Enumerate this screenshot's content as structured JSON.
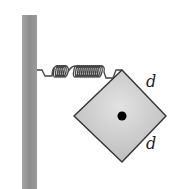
{
  "diagram": {
    "labels": {
      "side_top": "d",
      "side_bottom": "d"
    },
    "colors": {
      "wall": "#8f8f8f",
      "block_fill": "#c9c9c9",
      "block_edge": "#333333",
      "spring": "#444444",
      "pivot_dot": "#000000"
    }
  }
}
